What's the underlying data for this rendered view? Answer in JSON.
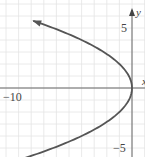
{
  "chart_data": {
    "type": "line",
    "title": "",
    "equation": "x = -y^2/4",
    "xlabel": "x",
    "ylabel": "y",
    "xlim": [
      -10.5,
      1
    ],
    "ylim": [
      -5.8,
      7
    ],
    "grid": true,
    "x_tick_labels": [
      "-10"
    ],
    "y_tick_labels": [
      "5",
      "-5"
    ],
    "series": [
      {
        "name": "parabola",
        "color": "#555555",
        "points": [
          {
            "x": -7.8,
            "y": 5.6
          },
          {
            "x": -4,
            "y": 4
          },
          {
            "x": -2.25,
            "y": 3
          },
          {
            "x": -1,
            "y": 2
          },
          {
            "x": -0.25,
            "y": 1
          },
          {
            "x": 0,
            "y": 0
          },
          {
            "x": -0.25,
            "y": -1
          },
          {
            "x": -1,
            "y": -2
          },
          {
            "x": -2.25,
            "y": -3
          },
          {
            "x": -4,
            "y": -4
          },
          {
            "x": -6.25,
            "y": -5
          },
          {
            "x": -8.4,
            "y": -5.8
          }
        ],
        "arrow_at": "upper-left"
      }
    ]
  },
  "labels": {
    "x_axis": "x",
    "y_axis": "y",
    "tick_neg10": "−10",
    "tick_5": "5",
    "tick_neg5": "−5"
  },
  "colors": {
    "grid": "#e4e4e4",
    "axis": "#666666",
    "curve": "#555555"
  }
}
